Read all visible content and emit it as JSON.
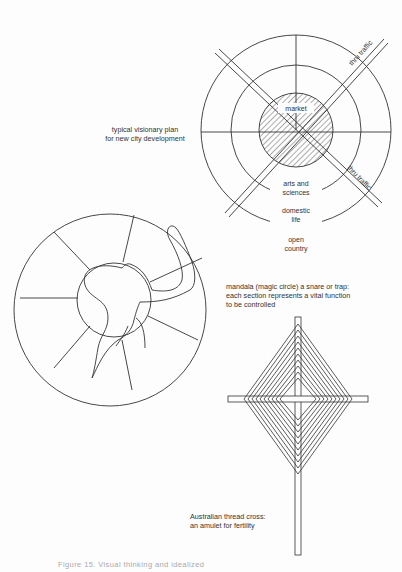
{
  "document": {
    "type": "book-page-illustration",
    "figures": [
      {
        "id": "city-plan",
        "caption_lines": [
          "typical visionary plan",
          "for new city development"
        ],
        "labels": {
          "center": "market",
          "ring1": [
            "arts and",
            "sciences"
          ],
          "ring2": [
            "domestic",
            "life"
          ],
          "outer": [
            "open",
            "country"
          ],
          "road_ne": "thru traffic",
          "road_se": "thru traffic"
        }
      },
      {
        "id": "mandala",
        "caption_lines": [
          "mandala (magic circle) a snare or trap:",
          "each section represents a vital function",
          "to be controlled"
        ]
      },
      {
        "id": "thread-cross",
        "caption_lines": [
          "Australian thread cross:",
          "an amulet for fertility"
        ]
      }
    ],
    "footer_caption": "Figure 15.  Visual thinking and idealized"
  },
  "colors": {
    "ink": "#333333",
    "paper": "#fdfdfd",
    "faded": "#aaaaaa"
  }
}
